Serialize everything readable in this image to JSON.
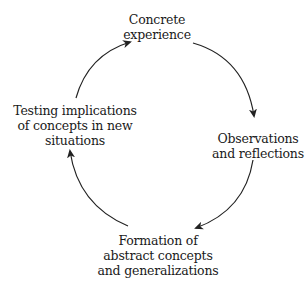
{
  "diagram": {
    "type": "cycle",
    "nodes": [
      {
        "id": "concrete",
        "lines": [
          "Concrete",
          "experience"
        ]
      },
      {
        "id": "observations",
        "lines": [
          "Observations",
          "and reflections"
        ]
      },
      {
        "id": "formation",
        "lines": [
          "Formation of",
          "abstract concepts",
          "and generalizations"
        ]
      },
      {
        "id": "testing",
        "lines": [
          "Testing implications",
          "of concepts in new",
          "situations"
        ]
      }
    ],
    "edges": [
      {
        "from": "concrete",
        "to": "observations"
      },
      {
        "from": "observations",
        "to": "formation"
      },
      {
        "from": "formation",
        "to": "testing"
      },
      {
        "from": "testing",
        "to": "concrete"
      }
    ],
    "colors": {
      "stroke": "#222222",
      "text": "#1a1a1a",
      "background": "#ffffff"
    }
  }
}
